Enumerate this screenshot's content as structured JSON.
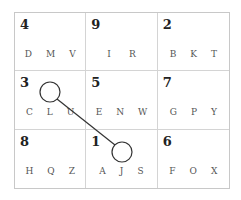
{
  "puzzle": {
    "cells": [
      {
        "number": "4",
        "letters": [
          "D",
          "M",
          "V"
        ]
      },
      {
        "number": "9",
        "letters": [
          "I",
          "R"
        ]
      },
      {
        "number": "2",
        "letters": [
          "B",
          "K",
          "T"
        ]
      },
      {
        "number": "3",
        "letters": [
          "C",
          "L",
          "U"
        ]
      },
      {
        "number": "5",
        "letters": [
          "E",
          "N",
          "W"
        ]
      },
      {
        "number": "7",
        "letters": [
          "G",
          "P",
          "Y"
        ]
      },
      {
        "number": "8",
        "letters": [
          "H",
          "Q",
          "Z"
        ]
      },
      {
        "number": "1",
        "letters": [
          "A",
          "J",
          "S"
        ]
      },
      {
        "number": "6",
        "letters": [
          "F",
          "O",
          "X"
        ]
      }
    ],
    "connection": {
      "from_cell": "3",
      "to_cell": "1",
      "stroke_color": "#333333"
    }
  }
}
